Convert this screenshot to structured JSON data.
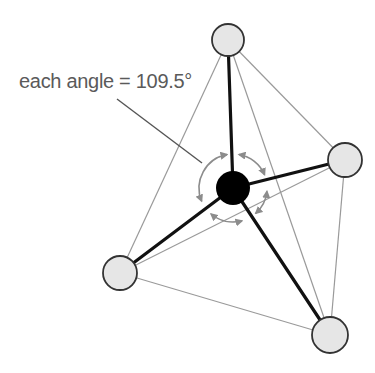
{
  "diagram": {
    "label": "each angle = 109.5°",
    "colors": {
      "background": "#ffffff",
      "central_atom": "#000000",
      "outer_atom_fill": "#e6e6e6",
      "outer_atom_stroke": "#333333",
      "bond": "#111111",
      "edge": "#9a9a9a",
      "angle_arc": "#8c8c8c",
      "pointer": "#555555",
      "label": "#5a5a5a"
    },
    "central_atom": {
      "cx": 233,
      "cy": 188,
      "r": 17
    },
    "outer_atoms": [
      {
        "name": "top",
        "cx": 228,
        "cy": 40,
        "r": 16
      },
      {
        "name": "right",
        "cx": 345,
        "cy": 160,
        "r": 17
      },
      {
        "name": "left",
        "cx": 120,
        "cy": 273,
        "r": 17
      },
      {
        "name": "bottom-right",
        "cx": 330,
        "cy": 335,
        "r": 18
      }
    ],
    "angle_marker": {
      "cx": 233,
      "cy": 188,
      "r": 34
    },
    "pointer": {
      "x1": 117,
      "y1": 99,
      "x2": 202,
      "y2": 163
    },
    "label_position": {
      "x": 19,
      "y": 88
    }
  }
}
